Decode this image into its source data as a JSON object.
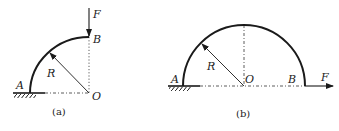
{
  "figures": [
    {
      "caption": "(a)",
      "labels": {
        "A": "A",
        "B": "B",
        "O": "O",
        "R": "R",
        "F": "F"
      },
      "description": "Quarter-circle curved beam of radius R fixed at A, load F applied vertically downward at B"
    },
    {
      "caption": "(b)",
      "labels": {
        "A": "A",
        "B": "B",
        "O": "O",
        "R": "R",
        "F": "F"
      },
      "description": "Semicircular curved beam of radius R fixed at A, load F applied horizontally to the right at B"
    }
  ],
  "colors": {
    "stroke": "#1a1a1a"
  }
}
